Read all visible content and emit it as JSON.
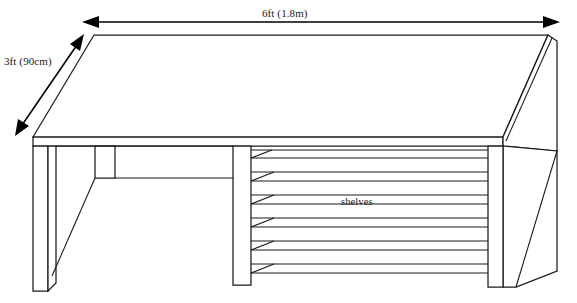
{
  "drawing": {
    "title": "table-with-shelves-perspective-drawing",
    "subject": "table",
    "view": "perspective",
    "background_color": "#ffffff",
    "line_color": "#1a1a1a",
    "dimension_color": "#000000"
  },
  "dimensions": {
    "width": {
      "label": "6ft (1.8m)",
      "value_imperial": "6ft",
      "value_metric": "1.8m",
      "orientation": "horizontal",
      "arrow_style": "double-headed",
      "position": "top"
    },
    "depth": {
      "label": "3ft (90cm)",
      "value_imperial": "3ft",
      "value_metric": "90cm",
      "orientation": "diagonal",
      "arrow_style": "double-headed",
      "position": "left"
    }
  },
  "annotations": {
    "shelves": {
      "label": "shelves",
      "count": 6,
      "location": "right-bay"
    }
  },
  "parts": {
    "tabletop": "tabletop",
    "left_leg": "left-leg",
    "middle_leg": "middle-leg",
    "right_leg": "right-leg",
    "left_brace": "left-diagonal-brace",
    "apron": "apron-rail",
    "side_panel": "right-side-panel"
  }
}
